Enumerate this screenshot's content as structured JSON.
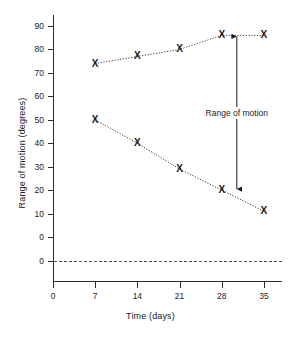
{
  "chart_data": {
    "type": "line",
    "title": "",
    "xlabel": "Time (days)",
    "ylabel": "Range of motion (degrees)",
    "x": [
      7,
      14,
      21,
      28,
      35
    ],
    "xlim": [
      0,
      38
    ],
    "ylim": [
      -8,
      95
    ],
    "xticks": [
      0,
      7,
      14,
      21,
      28,
      35
    ],
    "xtick_labels": [
      "0",
      "7",
      "14",
      "21",
      "28",
      "35"
    ],
    "yticks": [
      90,
      80,
      70,
      60,
      50,
      40,
      30,
      20,
      10,
      0
    ],
    "ytick_labels": [
      "90",
      "80",
      "70",
      "60",
      "50",
      "40",
      "30",
      "20",
      "10",
      "0"
    ],
    "baseline": {
      "value": 0,
      "label": "0",
      "style": "dashed"
    },
    "grid": false,
    "legend": null,
    "marker": "X",
    "line_style": "dotted",
    "series": [
      {
        "name": "upper",
        "values": [
          74,
          77,
          80,
          86,
          86
        ]
      },
      {
        "name": "lower",
        "values": [
          50,
          40,
          29,
          20,
          11
        ]
      }
    ],
    "annotations": [
      {
        "text": "Range of motion",
        "type": "double-arrow",
        "x": 30.5,
        "y_top": 86,
        "y_bottom": 20
      }
    ]
  }
}
